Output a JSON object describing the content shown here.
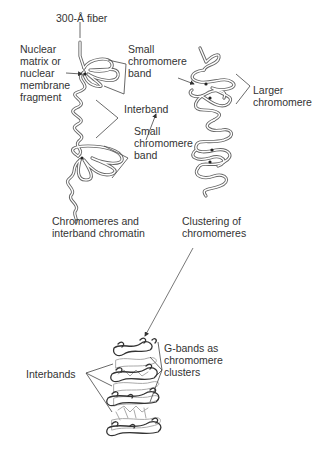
{
  "figure": {
    "top_section": {
      "labels": {
        "fiber": "300-Å fiber",
        "nuclear_matrix": [
          "Nuclear",
          "matrix or",
          "nuclear",
          "membrane",
          "fragment"
        ],
        "small_band_top": [
          "Small",
          "chromomere",
          "band"
        ],
        "interband": "Interband",
        "small_band_bottom": [
          "Small",
          "chromomere",
          "band"
        ],
        "larger_chromomere": [
          "Larger",
          "chromomere"
        ]
      },
      "captions": {
        "left": [
          "Chromomeres and",
          "interband chromatin"
        ],
        "right": [
          "Clustering of",
          "chromomeres"
        ]
      }
    },
    "bottom_section": {
      "labels": {
        "interbands": "Interbands",
        "g_bands": [
          "G-bands as",
          "chromomere",
          "clusters"
        ]
      }
    },
    "colors": {
      "line": "#555555",
      "fiber_fill": "#ffffff",
      "text": "#333333",
      "dark_band": "#444444",
      "light_band": "#aaaaaa"
    }
  }
}
